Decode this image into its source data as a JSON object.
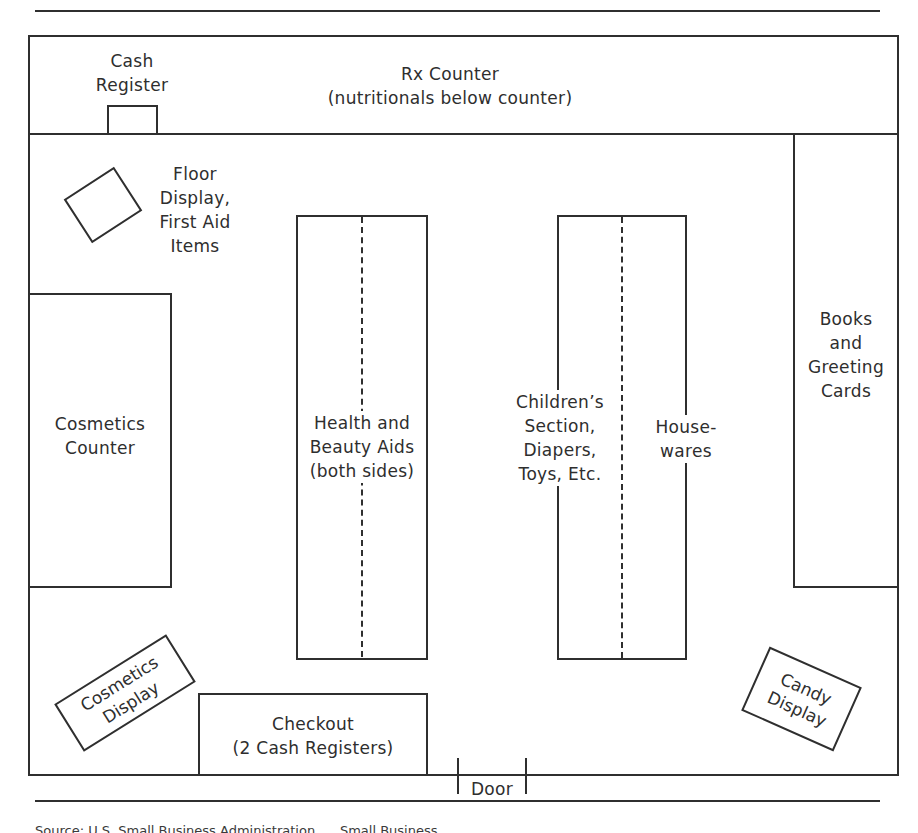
{
  "diagram": {
    "type": "store floor plan",
    "colors": {
      "line": "#2f2f2f",
      "text": "#2e2e2e",
      "background": "#ffffff"
    },
    "areas": {
      "cash_register": {
        "label": "Cash\nRegister"
      },
      "rx_counter": {
        "label": "Rx Counter\n(nutritionals below counter)"
      },
      "floor_display": {
        "label": "Floor\nDisplay,\nFirst Aid\nItems"
      },
      "cosmetics_counter": {
        "label": "Cosmetics\nCounter"
      },
      "health_beauty": {
        "label": "Health and\nBeauty Aids\n(both sides)"
      },
      "childrens_section": {
        "label": "Children’s\nSection,\nDiapers,\nToys, Etc."
      },
      "housewares": {
        "label": "House-\nwares"
      },
      "books_cards": {
        "label": "Books\nand\nGreeting\nCards"
      },
      "cosmetics_display": {
        "label": "Cosmetics\nDisplay"
      },
      "checkout": {
        "label": "Checkout\n(2 Cash Registers)"
      },
      "candy_display": {
        "label": "Candy\nDisplay"
      },
      "door": {
        "label": "Door"
      }
    },
    "caption": "Source: U.S. Small Business Administration, ... Small Business ..."
  }
}
